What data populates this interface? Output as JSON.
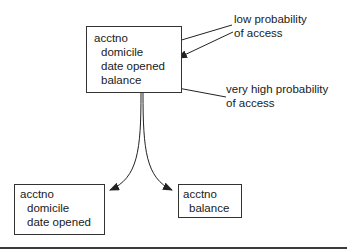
{
  "diagram": {
    "source_record": {
      "fields": [
        "acctno",
        "domicile",
        "date opened",
        "balance"
      ]
    },
    "split_left": {
      "fields": [
        "acctno",
        "domicile",
        "date opened"
      ]
    },
    "split_right": {
      "fields": [
        "acctno",
        "balance"
      ]
    },
    "annotations": {
      "low": {
        "line1": "low probability",
        "line2": "of access"
      },
      "high": {
        "line1": "very high probability",
        "line2": "of access"
      }
    }
  },
  "colors": {
    "stroke": "#333333",
    "text": "#1a1a1a",
    "rule": "#3a3a3a"
  }
}
